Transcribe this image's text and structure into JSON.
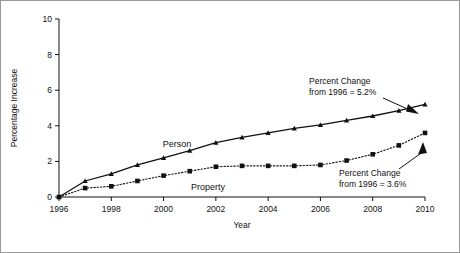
{
  "chart_data": {
    "type": "line",
    "title": "",
    "xlabel": "Year",
    "ylabel": "Percentage Increase",
    "xlim": [
      1996,
      2010
    ],
    "ylim": [
      0,
      10
    ],
    "grid": false,
    "legend_position": "inline-labels",
    "x": [
      1996,
      1997,
      1998,
      1999,
      2000,
      2001,
      2002,
      2003,
      2004,
      2005,
      2006,
      2007,
      2008,
      2009,
      2010
    ],
    "xtick_labels": [
      "1996",
      "1998",
      "2000",
      "2002",
      "2004",
      "2006",
      "2008",
      "2010"
    ],
    "xtick_values": [
      1996,
      1998,
      2000,
      2002,
      2004,
      2006,
      2008,
      2010
    ],
    "ytick_labels": [
      "0",
      "2",
      "4",
      "6",
      "8",
      "10"
    ],
    "ytick_values": [
      0,
      2,
      4,
      6,
      8,
      10
    ],
    "series": [
      {
        "name": "Person",
        "marker": "triangle",
        "linestyle": "solid",
        "color": "#111111",
        "label_text": "Person",
        "values": [
          0.0,
          0.9,
          1.3,
          1.8,
          2.2,
          2.6,
          3.05,
          3.35,
          3.6,
          3.85,
          4.05,
          4.3,
          4.55,
          4.85,
          5.2
        ]
      },
      {
        "name": "Property",
        "marker": "square",
        "linestyle": "dotted",
        "color": "#111111",
        "label_text": "Property",
        "values": [
          0.0,
          0.5,
          0.6,
          0.9,
          1.2,
          1.45,
          1.7,
          1.75,
          1.75,
          1.75,
          1.8,
          2.05,
          2.4,
          2.9,
          3.6
        ]
      }
    ],
    "annotations": [
      {
        "id": "person-endpoint",
        "line1": "Percent Change",
        "line2": "from 1996 = 5.2%",
        "points_to_year": 2010,
        "points_to_value": 5.2
      },
      {
        "id": "property-endpoint",
        "line1": "Percent Change",
        "line2": "from 1996 = 3.6%",
        "points_to_year": 2010,
        "points_to_value": 3.6
      }
    ]
  }
}
